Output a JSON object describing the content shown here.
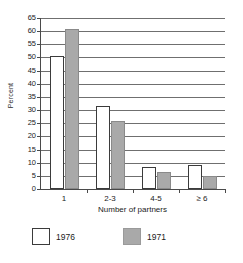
{
  "chart_data": {
    "type": "bar",
    "title": "",
    "xlabel": "Number of partners",
    "ylabel": "Percent",
    "categories": [
      "1",
      "2-3",
      "4-5",
      "≥ 6"
    ],
    "series": [
      {
        "name": "1976",
        "color": "#ffffff",
        "values": [
          50.5,
          31.5,
          8.5,
          9.0
        ]
      },
      {
        "name": "1971",
        "color": "#a9a9a9",
        "values": [
          61.0,
          26.0,
          6.3,
          5.0
        ]
      }
    ],
    "ylim": [
      0,
      65
    ],
    "ytick_step": 5,
    "yticks": [
      0,
      5,
      10,
      15,
      20,
      25,
      30,
      35,
      40,
      45,
      50,
      55,
      60,
      65
    ],
    "ytick_labels": [
      "0",
      "5",
      "10",
      "15",
      "20",
      "25",
      "30",
      "35",
      "40",
      "45",
      "50",
      "55",
      "60",
      "65"
    ],
    "grid": true,
    "grid_axis": "y",
    "legend_position": "bottom",
    "legend_entries": [
      {
        "label": "1976",
        "swatch": "white-square"
      },
      {
        "label": "1971",
        "swatch": "gray-square"
      }
    ]
  }
}
